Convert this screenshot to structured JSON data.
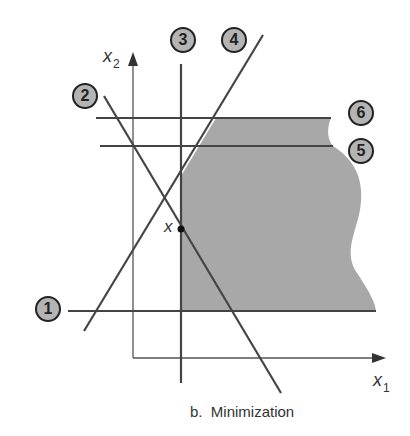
{
  "caption": "b.  Minimization",
  "axes": {
    "x1": {
      "symbol": "x",
      "subscript": "1"
    },
    "x2": {
      "symbol": "x",
      "subscript": "2"
    }
  },
  "point": {
    "label": "x"
  },
  "constraints": [
    {
      "id": "1",
      "label": "1"
    },
    {
      "id": "2",
      "label": "2"
    },
    {
      "id": "3",
      "label": "3"
    },
    {
      "id": "4",
      "label": "4"
    },
    {
      "id": "5",
      "label": "5"
    },
    {
      "id": "6",
      "label": "6"
    }
  ],
  "colors": {
    "feasible_region": "#a8a8a8",
    "lines": "#444444",
    "label_fill": "#b4b4b4"
  }
}
